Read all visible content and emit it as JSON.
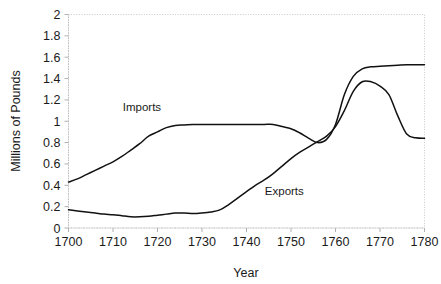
{
  "chart_data": {
    "type": "line",
    "title": "",
    "xlabel": "Year",
    "ylabel": "Millions of Pounds",
    "xlim": [
      1700,
      1780
    ],
    "ylim": [
      0,
      2
    ],
    "xticks": [
      1700,
      1710,
      1720,
      1730,
      1740,
      1750,
      1760,
      1770,
      1780
    ],
    "xtick_labels": [
      "1700",
      "1710",
      "1720",
      "1730",
      "1740",
      "1750",
      "1760",
      "1770",
      "1780"
    ],
    "yticks": [
      0,
      0.2,
      0.4,
      0.6,
      0.8,
      1,
      1.2,
      1.4,
      1.6,
      1.8,
      2
    ],
    "ytick_labels": [
      "0",
      "0.2",
      "0.4",
      "0.6",
      "0.8",
      "1",
      "1.2",
      "1.4",
      "1.6",
      "1.8",
      "2"
    ],
    "grid": false,
    "legend_position": "inline-annotation",
    "line_color": "#111111",
    "border_color": "#c8c8c8",
    "background": "#ffffff",
    "annotations": [
      {
        "text": "Imports",
        "x": 1716.5,
        "y": 1.1
      },
      {
        "text": "Exports",
        "x": 1748.5,
        "y": 0.31
      }
    ],
    "series": [
      {
        "name": "Imports",
        "x": [
          1700,
          1702,
          1704,
          1706,
          1708,
          1710,
          1712,
          1714,
          1716,
          1718,
          1720,
          1722,
          1724,
          1726,
          1728,
          1730,
          1732,
          1734,
          1736,
          1738,
          1740,
          1742,
          1744,
          1746,
          1748,
          1750,
          1752,
          1754,
          1756,
          1758,
          1760,
          1762,
          1764,
          1766,
          1768,
          1770,
          1772,
          1774,
          1776,
          1778,
          1780
        ],
        "values": [
          0.43,
          0.46,
          0.5,
          0.54,
          0.58,
          0.62,
          0.67,
          0.73,
          0.79,
          0.86,
          0.9,
          0.94,
          0.96,
          0.965,
          0.97,
          0.97,
          0.97,
          0.97,
          0.97,
          0.97,
          0.97,
          0.97,
          0.97,
          0.97,
          0.95,
          0.93,
          0.89,
          0.84,
          0.8,
          0.83,
          0.97,
          1.25,
          1.42,
          1.49,
          1.51,
          1.515,
          1.52,
          1.525,
          1.53,
          1.53,
          1.53
        ]
      },
      {
        "name": "Exports",
        "x": [
          1700,
          1702,
          1704,
          1706,
          1708,
          1710,
          1712,
          1714,
          1716,
          1718,
          1720,
          1722,
          1724,
          1726,
          1728,
          1730,
          1732,
          1734,
          1736,
          1738,
          1740,
          1742,
          1744,
          1746,
          1748,
          1750,
          1752,
          1754,
          1756,
          1758,
          1760,
          1762,
          1764,
          1766,
          1768,
          1770,
          1772,
          1774,
          1776,
          1778,
          1780
        ],
        "values": [
          0.17,
          0.16,
          0.15,
          0.14,
          0.13,
          0.125,
          0.115,
          0.105,
          0.105,
          0.11,
          0.12,
          0.13,
          0.14,
          0.14,
          0.135,
          0.14,
          0.15,
          0.17,
          0.22,
          0.28,
          0.34,
          0.4,
          0.45,
          0.51,
          0.58,
          0.65,
          0.71,
          0.76,
          0.81,
          0.86,
          0.95,
          1.1,
          1.28,
          1.37,
          1.37,
          1.33,
          1.25,
          1.05,
          0.88,
          0.845,
          0.84
        ]
      }
    ]
  }
}
